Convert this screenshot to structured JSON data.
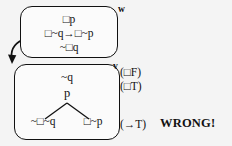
{
  "diagram": {
    "background_color": "#f4f4f4",
    "line_color": "#111111"
  },
  "world_w": {
    "label": "w",
    "formulas": [
      {
        "name": "box-p",
        "text": "□p"
      },
      {
        "name": "implication",
        "text": "□~q→□~p"
      },
      {
        "name": "not-box-q",
        "text": "~□q"
      }
    ]
  },
  "world_v": {
    "label": "v",
    "root": "~q",
    "node": "p",
    "leaves": [
      {
        "name": "leaf-left",
        "text": "~□~q"
      },
      {
        "name": "leaf-right",
        "text": "□~p"
      }
    ]
  },
  "annotations": [
    {
      "name": "box-false",
      "text": "(□F)"
    },
    {
      "name": "box-true",
      "text": "(□T)"
    },
    {
      "name": "arrow-true",
      "text": "(→T)"
    }
  ],
  "verdict": {
    "text": "WRONG!"
  },
  "accessibility": {
    "arrow_name": "accessibility-arrow"
  }
}
